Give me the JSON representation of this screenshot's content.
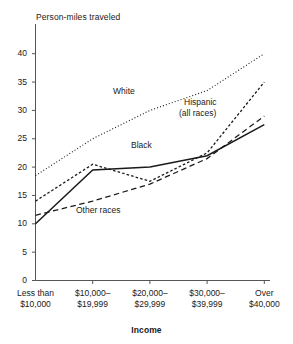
{
  "chart_data": {
    "type": "line",
    "title": "",
    "ylabel": "Person-miles traveled",
    "xlabel": "Income",
    "categories": [
      "Less than\n$10,000",
      "$10,000–\n$19,999",
      "$20,000–\n$29,999",
      "$30,000–\n$39,999",
      "Over\n$40,000"
    ],
    "ylim": [
      0,
      40
    ],
    "yticks": [
      0,
      5,
      10,
      15,
      20,
      25,
      30,
      35,
      40
    ],
    "ytick_labels": [
      "0",
      "5",
      "10",
      "15",
      "20",
      "25",
      "30",
      "35",
      "40"
    ],
    "grid": false,
    "legend": "inline-annotations",
    "series": [
      {
        "name": "White",
        "style": "dotted",
        "values": [
          18.5,
          25.0,
          30.0,
          33.5,
          40.0
        ]
      },
      {
        "name": "Hispanic (all races)",
        "style": "dashed-dotted",
        "values": [
          14.0,
          20.5,
          17.5,
          22.5,
          35.0
        ]
      },
      {
        "name": "Black",
        "style": "solid",
        "values": [
          10.0,
          19.5,
          20.0,
          22.0,
          27.5
        ]
      },
      {
        "name": "Other races",
        "style": "dashed",
        "values": [
          11.5,
          14.0,
          17.0,
          21.5,
          29.0
        ]
      }
    ],
    "annotations": [
      {
        "id": "white",
        "text": "White",
        "x": 113,
        "y": 86
      },
      {
        "id": "hispanic-line1",
        "text": "Hispanic",
        "x": 184,
        "y": 97
      },
      {
        "id": "hispanic-line2",
        "text": "(all races)",
        "x": 179,
        "y": 108
      },
      {
        "id": "black",
        "text": "Black",
        "x": 131,
        "y": 140
      },
      {
        "id": "other-races",
        "text": "Other races",
        "x": 76,
        "y": 205
      }
    ]
  },
  "colors": {
    "ink": "#1a1a1a",
    "axis": "#555555",
    "background": "#ffffff"
  }
}
